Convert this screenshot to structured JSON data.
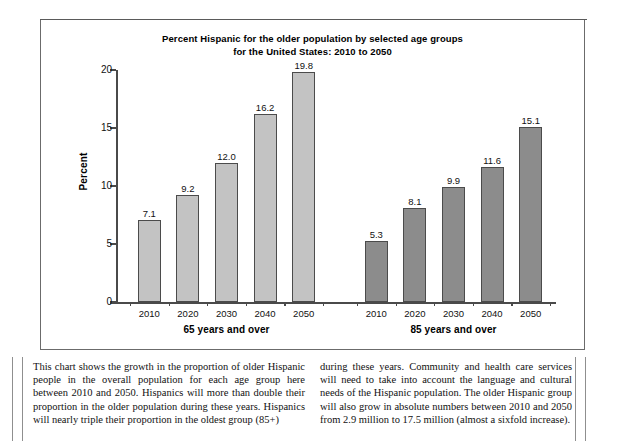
{
  "chart_data": {
    "type": "bar",
    "title": "Percent Hispanic for the older population by selected age groups for the United States: 2010 to 2050",
    "title_lines": [
      "Percent Hispanic for the older population by selected age groups",
      "for the United States: 2010 to 2050"
    ],
    "xlabel": "",
    "ylabel": "Percent",
    "ylim": [
      0,
      20
    ],
    "yticks": [
      0,
      5,
      10,
      15,
      20
    ],
    "ytick_labels": [
      "0",
      "5",
      "10",
      "15",
      "20"
    ],
    "grid": false,
    "legend": "none",
    "categories": [
      "2010",
      "2020",
      "2030",
      "2040",
      "2050"
    ],
    "groups": [
      {
        "name": "65 years and over",
        "color": "#c3c3c3",
        "values": [
          7.1,
          9.2,
          12.0,
          16.2,
          19.8
        ],
        "value_labels": [
          "7.1",
          "9.2",
          "12.0",
          "16.2",
          "19.8"
        ]
      },
      {
        "name": "85 years and over",
        "color": "#8c8c8c",
        "values": [
          5.3,
          8.1,
          9.9,
          11.6,
          15.1
        ],
        "value_labels": [
          "5.3",
          "8.1",
          "9.9",
          "11.6",
          "15.1"
        ]
      }
    ]
  },
  "caption": {
    "left": "This chart shows the growth in the proportion of older Hispanic people in the overall population for each age group here between 2010 and 2050. Hispanics will more than double their proportion in the older population during these years. Hispanics will nearly triple their proportion in the oldest group (85+)",
    "right": "during these years. Community and health care services will need to take into account the language and cultural needs of the Hispanic population. The older Hispanic group will also grow in absolute numbers between 2010 and 2050 from 2.9 million to 17.5 million (almost a sixfold increase)."
  },
  "colors": {
    "group1_fill": "#c3c3c3",
    "group2_fill": "#8c8c8c",
    "bar_stroke": "#4b4b4b",
    "axis": "#4a4a4a",
    "frame": "#6b6b6b",
    "text": "#111111"
  }
}
